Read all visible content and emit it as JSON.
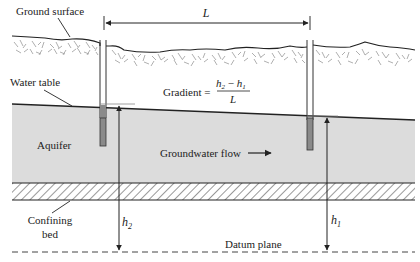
{
  "diagram": {
    "labels": {
      "ground_surface": "Ground surface",
      "water_table": "Water table",
      "aquifer": "Aquifer",
      "groundwater_flow": "Groundwater flow",
      "confining_bed_line1": "Confining",
      "confining_bed_line2": "bed",
      "datum_plane": "Datum plane",
      "distance": "L",
      "head_left": "h",
      "head_left_sub": "2",
      "head_right": "h",
      "head_right_sub": "1"
    },
    "formula": {
      "lhs": "Gradient =",
      "numerator_a": "h",
      "numerator_a_sub": "2",
      "minus": " − ",
      "numerator_b": "h",
      "numerator_b_sub": "1",
      "denominator": "L"
    },
    "colors": {
      "aquifer_fill": "#dcdcdc",
      "well_screen": "#8a8a8a",
      "line": "#222222",
      "soil_texture": "#9a9a9a"
    }
  }
}
